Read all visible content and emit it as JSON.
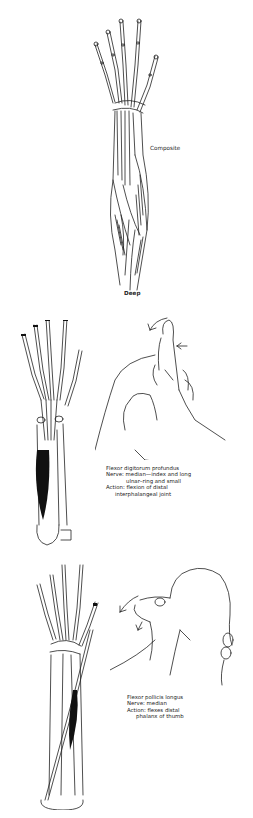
{
  "figure_top": {
    "title": "Forearm flexor muscles illustration",
    "labels": {
      "composite": "Composite",
      "deep": "Deep"
    }
  },
  "figure_middle": {
    "caption": {
      "muscle": "Flexor digitorum profundus",
      "nerve_line1": "Nerve: median—index and long",
      "nerve_line2": "ulnar–ring and small",
      "action_line1": "Action: flexion of distal",
      "action_line2": "interphalangeal joint"
    }
  },
  "figure_bottom": {
    "caption": {
      "muscle": "Flexor pollicis longus",
      "nerve": "Nerve: median",
      "action_line1": "Action: flexes distal",
      "action_line2": "phalanx of thumb"
    }
  },
  "colors": {
    "ink": "#1a1a1a",
    "background": "#ffffff",
    "muscle_fill": "#111111"
  }
}
